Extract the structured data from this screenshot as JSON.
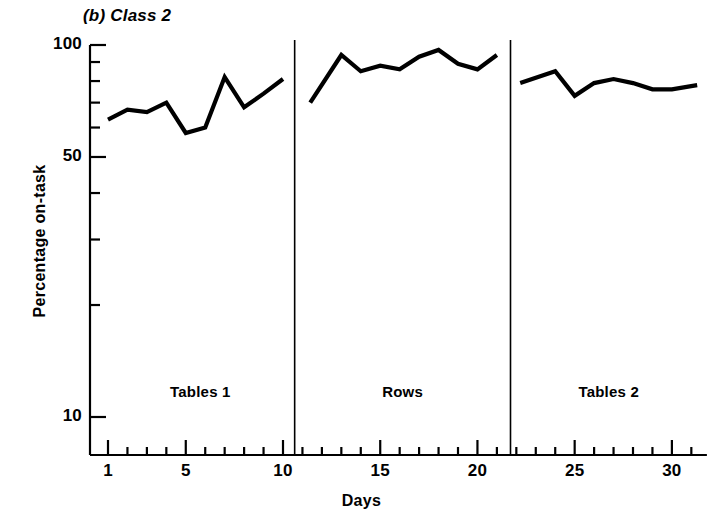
{
  "figure": {
    "title_prefix": "(b)",
    "title_text": "Class 2",
    "title_full": "(b) Class 2"
  },
  "chart_data": {
    "type": "line",
    "title": "(b) Class 2",
    "xlabel": "Days",
    "ylabel": "Percentage on-task",
    "yscale": "log",
    "ylim": [
      8,
      100
    ],
    "xlim": [
      0.2,
      32
    ],
    "grid": false,
    "legend": false,
    "y_tick_labels": [
      "100",
      "50",
      "10"
    ],
    "y_tick_values": [
      100,
      50,
      10
    ],
    "y_minor_ticks": [
      90,
      80,
      70,
      60,
      40,
      30,
      20
    ],
    "x_tick_labels": [
      "1",
      "5",
      "10",
      "15",
      "20",
      "25",
      "30"
    ],
    "x_tick_values": [
      1,
      5,
      10,
      15,
      20,
      25,
      30
    ],
    "x_minor_ticks": [
      2,
      3,
      4,
      6,
      7,
      8,
      9,
      11,
      12,
      13,
      14,
      16,
      17,
      18,
      19,
      21,
      22,
      23,
      24,
      26,
      27,
      28,
      29,
      31
    ],
    "phase_dividers": [
      10.6,
      21.7
    ],
    "phases": [
      {
        "name": "Tables 1",
        "label": "Tables 1",
        "x": [
          1,
          2,
          3,
          4,
          5,
          6,
          7,
          8,
          9,
          10
        ],
        "y": [
          63,
          67,
          66,
          70,
          58,
          60,
          82,
          68,
          74,
          81
        ]
      },
      {
        "name": "Rows",
        "label": "Rows",
        "x": [
          11.4,
          13,
          14,
          15,
          16,
          17,
          18,
          19,
          20,
          21
        ],
        "y": [
          70,
          94,
          85,
          88,
          86,
          93,
          97,
          89,
          86,
          94
        ]
      },
      {
        "name": "Tables 2",
        "label": "Tables 2",
        "x": [
          22.2,
          24,
          25,
          26,
          27,
          28,
          29,
          30,
          31.3
        ],
        "y": [
          79,
          85,
          73,
          79,
          81,
          79,
          76,
          76,
          78
        ]
      }
    ],
    "series": [
      {
        "name": "Percentage on-task",
        "x": [
          1,
          2,
          3,
          4,
          5,
          6,
          7,
          8,
          9,
          10,
          11.4,
          13,
          14,
          15,
          16,
          17,
          18,
          19,
          20,
          21,
          22.2,
          24,
          25,
          26,
          27,
          28,
          29,
          30,
          31.3
        ],
        "values": [
          63,
          67,
          66,
          70,
          58,
          60,
          82,
          68,
          74,
          81,
          70,
          94,
          85,
          88,
          86,
          93,
          97,
          89,
          86,
          94,
          79,
          85,
          73,
          79,
          81,
          79,
          76,
          76,
          78
        ]
      }
    ],
    "colors": {
      "line": "#000000",
      "axis": "#000000",
      "background": "#ffffff"
    }
  }
}
